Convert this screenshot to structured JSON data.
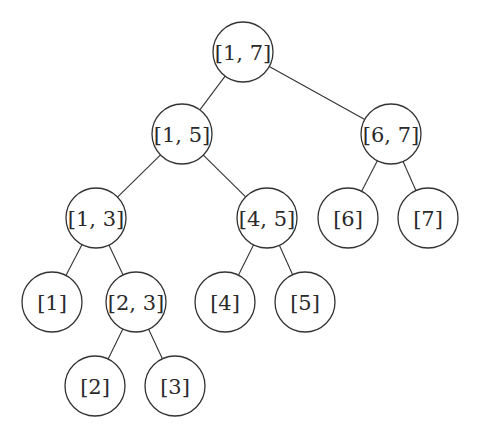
{
  "diagram": {
    "type": "segment-tree",
    "node_radius": 30,
    "nodes": [
      {
        "id": "n17",
        "label": "[1, 7]",
        "x": 243,
        "y": 52
      },
      {
        "id": "n15",
        "label": "[1, 5]",
        "x": 182,
        "y": 134
      },
      {
        "id": "n67",
        "label": "[6, 7]",
        "x": 391,
        "y": 134
      },
      {
        "id": "n13",
        "label": "[1, 3]",
        "x": 96,
        "y": 218
      },
      {
        "id": "n45",
        "label": "[4, 5]",
        "x": 267,
        "y": 218
      },
      {
        "id": "n6",
        "label": "[6]",
        "x": 348,
        "y": 218
      },
      {
        "id": "n7",
        "label": "[7]",
        "x": 428,
        "y": 218
      },
      {
        "id": "n1",
        "label": "[1]",
        "x": 52,
        "y": 302
      },
      {
        "id": "n23",
        "label": "[2, 3]",
        "x": 136,
        "y": 302
      },
      {
        "id": "n4",
        "label": "[4]",
        "x": 225,
        "y": 302
      },
      {
        "id": "n5",
        "label": "[5]",
        "x": 305,
        "y": 302
      },
      {
        "id": "n2",
        "label": "[2]",
        "x": 95,
        "y": 386
      },
      {
        "id": "n3",
        "label": "[3]",
        "x": 175,
        "y": 386
      }
    ],
    "edges": [
      [
        "n17",
        "n15"
      ],
      [
        "n17",
        "n67"
      ],
      [
        "n15",
        "n13"
      ],
      [
        "n15",
        "n45"
      ],
      [
        "n67",
        "n6"
      ],
      [
        "n67",
        "n7"
      ],
      [
        "n13",
        "n1"
      ],
      [
        "n13",
        "n23"
      ],
      [
        "n45",
        "n4"
      ],
      [
        "n45",
        "n5"
      ],
      [
        "n23",
        "n2"
      ],
      [
        "n23",
        "n3"
      ]
    ]
  }
}
